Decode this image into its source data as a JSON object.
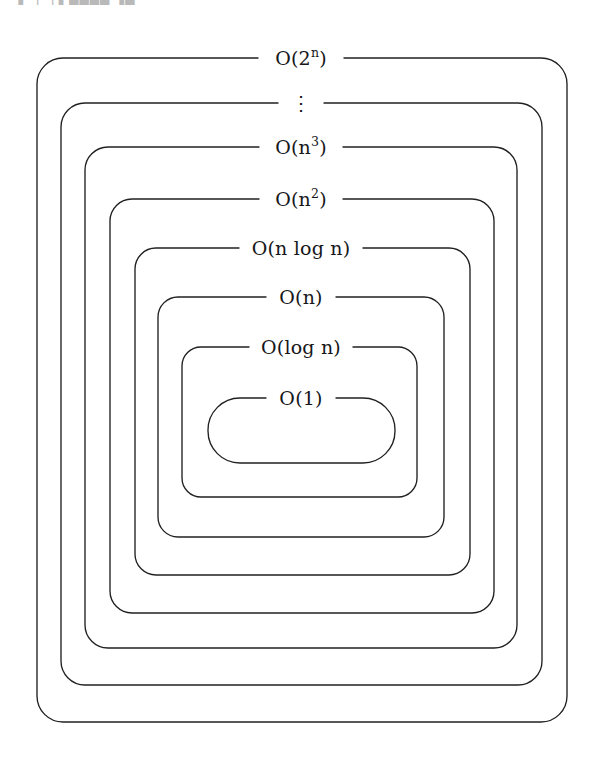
{
  "page": {
    "header_fragment": "▐  ▕ ▕▐ ▄▄▄▄ ▐▄",
    "background_color": "#ffffff",
    "stroke_color": "#20201f",
    "text_color": "#17171a",
    "width": 600,
    "height": 768
  },
  "diagram": {
    "type": "nested-containment",
    "level_count": 8,
    "levels": [
      {
        "id": "o-2-pow-n",
        "label": "O(2ⁿ)",
        "label_base": "O(2",
        "label_sup": "n",
        "label_tail": ")",
        "rank": 1,
        "shape": "rounded-rect",
        "box": {
          "x": 37,
          "y": 58,
          "width": 530,
          "height": 664,
          "radius": 26
        },
        "label_center": {
          "x": 301,
          "y": 58
        }
      },
      {
        "id": "ellipsis",
        "label": "⋮",
        "rank": 2,
        "shape": "rounded-rect",
        "box": {
          "x": 61,
          "y": 103,
          "width": 481,
          "height": 582,
          "radius": 24
        },
        "label_center": {
          "x": 301,
          "y": 103
        }
      },
      {
        "id": "o-n-cubed",
        "label": "O(n³)",
        "label_base": "O(n",
        "label_sup": "3",
        "label_tail": ")",
        "rank": 3,
        "shape": "rounded-rect",
        "box": {
          "x": 85,
          "y": 147,
          "width": 432,
          "height": 501,
          "radius": 23
        },
        "label_center": {
          "x": 301,
          "y": 147
        }
      },
      {
        "id": "o-n-squared",
        "label": "O(n²)",
        "label_base": "O(n",
        "label_sup": "2",
        "label_tail": ")",
        "rank": 4,
        "shape": "rounded-rect",
        "box": {
          "x": 110,
          "y": 199,
          "width": 384,
          "height": 414,
          "radius": 22
        },
        "label_center": {
          "x": 301,
          "y": 199
        }
      },
      {
        "id": "o-n-log-n",
        "label": "O(n log n)",
        "rank": 5,
        "shape": "rounded-rect",
        "box": {
          "x": 135,
          "y": 248,
          "width": 335,
          "height": 327,
          "radius": 21
        },
        "label_center": {
          "x": 301,
          "y": 248
        }
      },
      {
        "id": "o-n",
        "label": "O(n)",
        "rank": 6,
        "shape": "rounded-rect",
        "box": {
          "x": 158,
          "y": 297,
          "width": 286,
          "height": 240,
          "radius": 20
        },
        "label_center": {
          "x": 301,
          "y": 297
        }
      },
      {
        "id": "o-log-n",
        "label": "O(log n)",
        "rank": 7,
        "shape": "rounded-rect",
        "box": {
          "x": 182,
          "y": 347,
          "width": 235,
          "height": 150,
          "radius": 19
        },
        "label_center": {
          "x": 301,
          "y": 347
        }
      },
      {
        "id": "o-1",
        "label": "O(1)",
        "rank": 8,
        "shape": "stadium",
        "box": {
          "x": 208,
          "y": 398,
          "width": 187,
          "height": 65,
          "radius": 32
        },
        "label_center": {
          "x": 301,
          "y": 398
        }
      }
    ]
  }
}
